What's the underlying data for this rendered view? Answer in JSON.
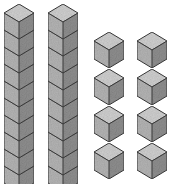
{
  "figure": {
    "total_cubes": 28
  },
  "palette": {
    "background": "#ffffff",
    "top_face": "#cfcfcf",
    "left_face": "#b4b4b4",
    "right_face": "#8e8e8e",
    "outline": "#3a3a3a",
    "speckle_light": "#e2e2e2",
    "speckle_dark": "#7a7a7a"
  },
  "geometry": {
    "cube_width": 26,
    "cube_top_depth": 9,
    "cube_body_height": 17,
    "rod_cube_height": 17,
    "rod_cube_count": 10
  },
  "towers": [
    {
      "name": "tower-left",
      "label": "rod of ten",
      "cube_count": 10,
      "x": 4,
      "y": 4,
      "cube_w": 30,
      "cube_h": 17,
      "depth": 9
    },
    {
      "name": "tower-right",
      "label": "rod of ten",
      "cube_count": 10,
      "x": 48,
      "y": 4,
      "cube_w": 30,
      "cube_h": 17,
      "depth": 9
    }
  ],
  "ones": {
    "label": "unit cubes",
    "count": 8,
    "columns": 2,
    "rows": 4,
    "origin_x": 94,
    "origin_y": 32,
    "col_gap": 43,
    "row_gap": 37,
    "cube_w": 30,
    "cube_h": 18,
    "depth": 9,
    "items": [
      {
        "name": "unit-cube-1",
        "row": 1,
        "col": 1
      },
      {
        "name": "unit-cube-2",
        "row": 1,
        "col": 2
      },
      {
        "name": "unit-cube-3",
        "row": 2,
        "col": 1
      },
      {
        "name": "unit-cube-4",
        "row": 2,
        "col": 2
      },
      {
        "name": "unit-cube-5",
        "row": 3,
        "col": 1
      },
      {
        "name": "unit-cube-6",
        "row": 3,
        "col": 2
      },
      {
        "name": "unit-cube-7",
        "row": 4,
        "col": 1
      },
      {
        "name": "unit-cube-8",
        "row": 4,
        "col": 2
      }
    ]
  }
}
